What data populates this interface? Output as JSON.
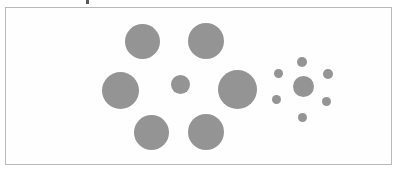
{
  "figure": {
    "name": "Ebbinghaus illusion",
    "background_color": "#ffffff",
    "circle_color": "#949494",
    "frame_color": "#b9b9b9",
    "frame": {
      "x": 5,
      "y": 7,
      "width": 387,
      "height": 158
    },
    "artifacts": [
      {
        "name": "top-speck",
        "x": 86,
        "y": 0,
        "width": 3,
        "height": 4,
        "color": "#5a5a5a"
      }
    ],
    "groups": [
      {
        "name": "left-group",
        "label": "large-surround",
        "center": {
          "name": "left-center-disk",
          "cx": 179,
          "cy": 83,
          "r": 9.5
        },
        "surround": [
          {
            "name": "left-surround-top-left",
            "cx": 141,
            "cy": 40,
            "r": 17.5
          },
          {
            "name": "left-surround-top-right",
            "cx": 205,
            "cy": 40,
            "r": 18.0
          },
          {
            "name": "left-surround-left",
            "cx": 119,
            "cy": 89,
            "r": 18.5
          },
          {
            "name": "left-surround-right",
            "cx": 236,
            "cy": 88,
            "r": 19.5
          },
          {
            "name": "left-surround-bottom-left",
            "cx": 150,
            "cy": 131,
            "r": 17.5
          },
          {
            "name": "left-surround-bottom-right",
            "cx": 205,
            "cy": 131,
            "r": 18.0
          }
        ]
      },
      {
        "name": "right-group",
        "label": "small-surround",
        "center": {
          "name": "right-center-disk",
          "cx": 302,
          "cy": 85,
          "r": 10.5
        },
        "surround": [
          {
            "name": "right-surround-top",
            "cx": 301,
            "cy": 61,
            "r": 5.0
          },
          {
            "name": "right-surround-upper-left",
            "cx": 277,
            "cy": 72,
            "r": 4.5
          },
          {
            "name": "right-surround-upper-right",
            "cx": 327,
            "cy": 73,
            "r": 5.0
          },
          {
            "name": "right-surround-lower-left",
            "cx": 275,
            "cy": 98,
            "r": 4.5
          },
          {
            "name": "right-surround-lower-right",
            "cx": 325,
            "cy": 100,
            "r": 4.5
          },
          {
            "name": "right-surround-bottom",
            "cx": 301,
            "cy": 116,
            "r": 4.5
          }
        ]
      }
    ]
  }
}
